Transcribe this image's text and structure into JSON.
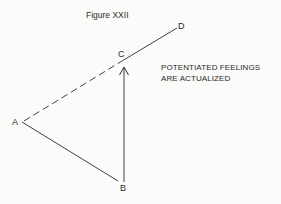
{
  "figure": {
    "title": "Figure XXII",
    "caption_lines": [
      "POTENTIATED FEELINGS",
      "ARE ACTUALIZED"
    ]
  },
  "points": {
    "A": {
      "label": "A",
      "x": 22,
      "y": 122
    },
    "B": {
      "label": "B",
      "x": 123,
      "y": 181
    },
    "C": {
      "label": "C",
      "x": 124,
      "y": 60
    },
    "D": {
      "label": "D",
      "x": 177,
      "y": 28
    }
  },
  "segments": [
    {
      "from": "A",
      "to": "B",
      "style": "solid"
    },
    {
      "from": "A",
      "to": "C",
      "style": "dashed"
    },
    {
      "from": "C",
      "to": "D",
      "style": "solid"
    },
    {
      "from": "B",
      "to": "C",
      "style": "arrow"
    }
  ],
  "colors": {
    "ink": "#2a2a2a",
    "background": "#fbfbf9"
  }
}
